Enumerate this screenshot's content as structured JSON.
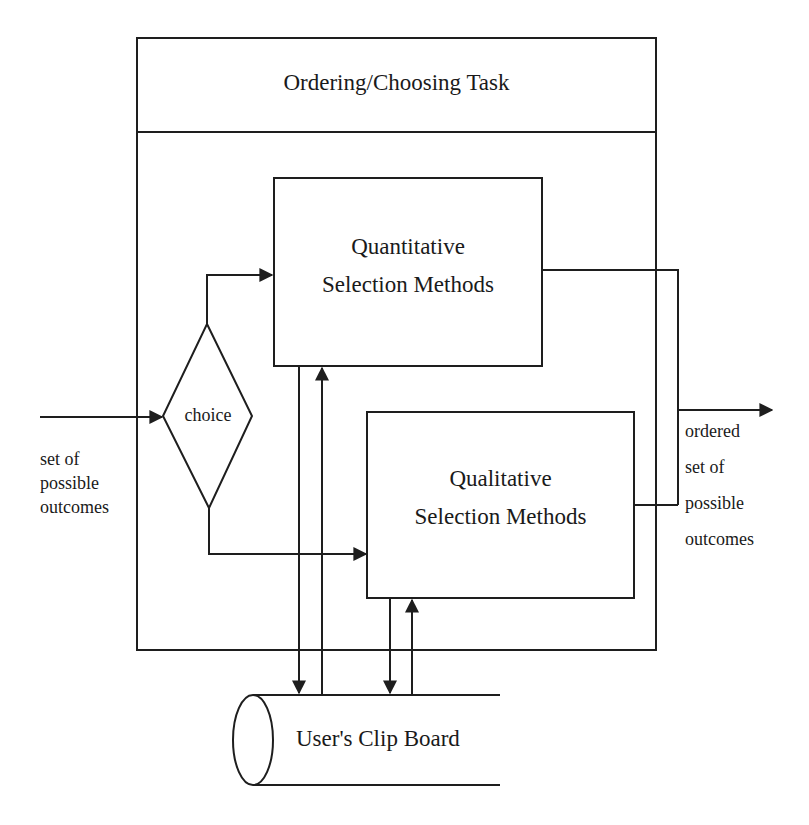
{
  "container": {
    "title": "Ordering/Choosing Task"
  },
  "decision": {
    "label": "choice"
  },
  "boxes": {
    "quantitative": {
      "line1": "Quantitative",
      "line2": "Selection Methods"
    },
    "qualitative": {
      "line1": "Qualitative",
      "line2": "Selection Methods"
    }
  },
  "input": {
    "lines": [
      "set of",
      "possible",
      "outcomes"
    ]
  },
  "output": {
    "lines": [
      "ordered",
      "set of",
      "possible",
      "outcomes"
    ]
  },
  "store": {
    "label": "User's Clip Board"
  },
  "colors": {
    "stroke": "#1e1e1e",
    "background": "#ffffff",
    "text": "#1a1a1a"
  }
}
